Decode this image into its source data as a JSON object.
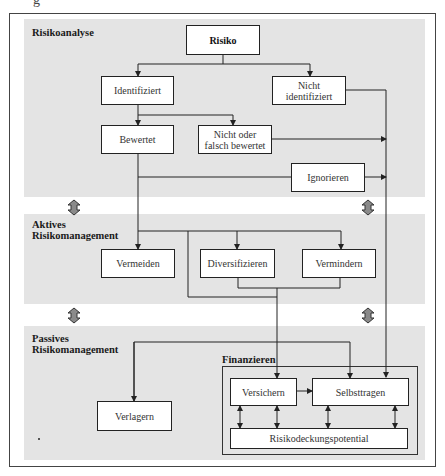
{
  "header_fragment": "g",
  "sections": [
    {
      "id": "risikoanalyse",
      "label": "Risikoanalyse"
    },
    {
      "id": "aktives",
      "label_line1": "Aktives",
      "label_line2": "Risikomanagement"
    },
    {
      "id": "passives",
      "label_line1": "Passives",
      "label_line2": "Risikomanagement"
    }
  ],
  "nodes": {
    "risiko": "Risiko",
    "identifiziert": "Identifiziert",
    "nicht_identifiziert_1": "Nicht",
    "nicht_identifiziert_2": "identifiziert",
    "bewertet": "Bewertet",
    "nicht_oder_falsch_1": "Nicht oder",
    "nicht_oder_falsch_2": "falsch bewertet",
    "ignorieren": "Ignorieren",
    "vermeiden": "Vermeiden",
    "diversifizieren": "Diversifizieren",
    "vermindern": "Vermindern",
    "verlagern": "Verlagern",
    "versichern": "Versichern",
    "selbsttragen": "Selbsttragen",
    "risikodeckungspotential": "Risikodeckungspotential"
  },
  "containers": {
    "finanzieren": "Finanzieren"
  },
  "colors": {
    "panel": "#e4e4e4",
    "line": "#222222",
    "double_arrow_fill": "#8a8a8a"
  }
}
